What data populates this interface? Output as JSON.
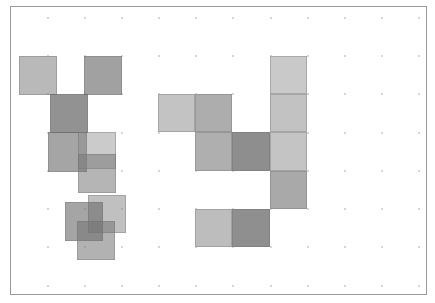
{
  "diagram": {
    "type": "grid-tile-layout",
    "frame": {
      "x": 10,
      "y": 6,
      "width": 417,
      "height": 289,
      "border_color": "#9a9a9a"
    },
    "grid": {
      "dot_color": "#c8c8c8",
      "dot_columns_x": [
        48,
        85,
        122,
        159,
        196,
        233,
        271,
        308,
        345,
        382,
        419
      ],
      "dot_rows_y": [
        18,
        56,
        94,
        133,
        171,
        209,
        247,
        286
      ]
    },
    "groups": [
      {
        "name": "left-cluster",
        "description": "scattered overlapping translucent squares",
        "tiles": [
          {
            "id": "L1",
            "x": 19,
            "y": 56,
            "w": 38,
            "h": 39,
            "color": "rgba(128,128,128,0.55)"
          },
          {
            "id": "L2",
            "x": 84,
            "y": 56,
            "w": 38,
            "h": 39,
            "color": "rgba(110,110,110,0.65)"
          },
          {
            "id": "L3",
            "x": 50,
            "y": 94,
            "w": 38,
            "h": 39,
            "color": "rgba(100,100,100,0.70)"
          },
          {
            "id": "L4",
            "x": 48,
            "y": 132,
            "w": 39,
            "h": 40,
            "color": "rgba(110,110,110,0.62)"
          },
          {
            "id": "L5",
            "x": 78,
            "y": 132,
            "w": 38,
            "h": 37,
            "color": "rgba(140,140,140,0.45)"
          },
          {
            "id": "L6",
            "x": 78,
            "y": 154,
            "w": 38,
            "h": 39,
            "color": "rgba(120,120,120,0.55)"
          },
          {
            "id": "L7",
            "x": 88,
            "y": 195,
            "w": 38,
            "h": 38,
            "color": "rgba(130,130,130,0.50)"
          },
          {
            "id": "L8",
            "x": 65,
            "y": 202,
            "w": 38,
            "h": 39,
            "color": "rgba(105,105,105,0.60)"
          },
          {
            "id": "L9",
            "x": 77,
            "y": 221,
            "w": 38,
            "h": 39,
            "color": "rgba(115,115,115,0.55)"
          }
        ]
      },
      {
        "name": "right-cluster",
        "description": "grid-aligned squares forming a shape",
        "tiles": [
          {
            "id": "R1",
            "x": 270,
            "y": 56,
            "w": 37,
            "h": 38,
            "color": "#c9c9c9"
          },
          {
            "id": "R2",
            "x": 158,
            "y": 94,
            "w": 37,
            "h": 38,
            "color": "#c3c3c3"
          },
          {
            "id": "R3",
            "x": 195,
            "y": 94,
            "w": 37,
            "h": 38,
            "color": "#adadad"
          },
          {
            "id": "R4",
            "x": 270,
            "y": 94,
            "w": 37,
            "h": 38,
            "color": "#c2c2c2"
          },
          {
            "id": "R5",
            "x": 195,
            "y": 132,
            "w": 37,
            "h": 39,
            "color": "#afafaf"
          },
          {
            "id": "R6",
            "x": 232,
            "y": 132,
            "w": 38,
            "h": 39,
            "color": "#8e8e8e"
          },
          {
            "id": "R7",
            "x": 270,
            "y": 132,
            "w": 37,
            "h": 39,
            "color": "#c4c4c4"
          },
          {
            "id": "R8",
            "x": 270,
            "y": 171,
            "w": 37,
            "h": 38,
            "color": "#a9a9a9"
          },
          {
            "id": "R9",
            "x": 195,
            "y": 209,
            "w": 37,
            "h": 38,
            "color": "#bdbdbd"
          },
          {
            "id": "R10",
            "x": 232,
            "y": 209,
            "w": 38,
            "h": 38,
            "color": "#8f8f8f"
          }
        ]
      }
    ]
  }
}
